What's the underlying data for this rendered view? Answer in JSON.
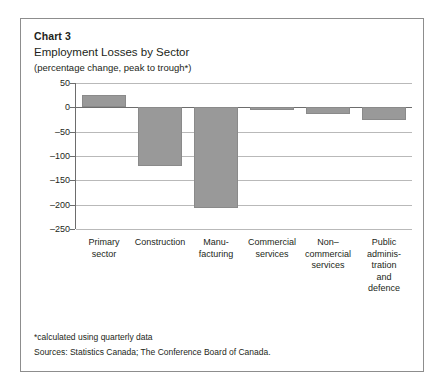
{
  "figure": {
    "chart_number": "Chart 3",
    "title": "Employment Losses by Sector",
    "subtitle": "(percentage change, peak to trough*)",
    "footnote": "*calculated using quarterly data",
    "source": "Sources: Statistics Canada; The Conference Board of Canada.",
    "bar_color": "#999999",
    "grid_color": "#b9b9b9",
    "axis_color": "#6d6d6d",
    "frame_color": "#8d8d8d",
    "text_color": "#231f20"
  },
  "chart_data": {
    "type": "bar",
    "title": "Employment Losses by Sector",
    "subtitle": "(percentage change, peak to trough*)",
    "xlabel": "",
    "ylabel": "",
    "ylim": [
      -250,
      50
    ],
    "yticks": [
      50,
      0,
      -50,
      -100,
      -150,
      -200,
      -250
    ],
    "ytick_labels": [
      "50",
      "0",
      "–50",
      "–100",
      "–150",
      "–200",
      "–250"
    ],
    "grid": true,
    "legend": "none",
    "categories": [
      "Primary sector",
      "Construction",
      "Manufacturing",
      "Commercial services",
      "Non-commercial services",
      "Public administration and defence"
    ],
    "category_label_lines": [
      [
        "Primary",
        "sector"
      ],
      [
        "Construction"
      ],
      [
        "Manu-",
        "facturing"
      ],
      [
        "Commercial",
        "services"
      ],
      [
        "Non–",
        "commercial",
        "services"
      ],
      [
        "Public",
        "adminis-",
        "tration",
        "and",
        "defence"
      ]
    ],
    "values": [
      26,
      -120,
      -206,
      -6,
      -13,
      -26
    ]
  }
}
